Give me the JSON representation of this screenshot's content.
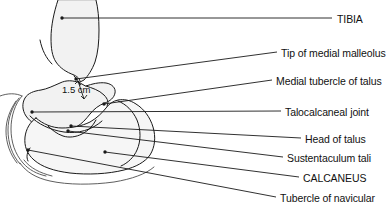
{
  "figure": {
    "type": "anatomical-line-diagram",
    "width": 392,
    "height": 214,
    "background_color": "#ffffff",
    "line_color": "#1a1a1a",
    "bone_fill_color": "#f2f2f2"
  },
  "measurement": {
    "value": "1.5 cm",
    "description": "Distance between tip of medial malleolus and medial tubercle of talus",
    "x": 62,
    "y": 85
  },
  "labels": [
    {
      "id": "tibia",
      "text": "TIBIA",
      "text_x": 337,
      "text_y": 14,
      "line_start_x": 62,
      "line_start_y": 18,
      "line_end_x": 332,
      "line_end_y": 18,
      "dot_x": 62,
      "dot_y": 18
    },
    {
      "id": "tip-of-medial-malleolus",
      "text": "Tip of medial malleolus",
      "text_x": 281,
      "text_y": 48,
      "line_start_x": 76,
      "line_start_y": 79,
      "line_end_x": 277,
      "line_end_y": 52,
      "dot_x": 76,
      "dot_y": 79
    },
    {
      "id": "medial-tubercle-of-talus",
      "text": "Medial tubercle of talus",
      "text_x": 276,
      "text_y": 76,
      "line_start_x": 104,
      "line_start_y": 104,
      "line_end_x": 272,
      "line_end_y": 80,
      "dot_x": 104,
      "dot_y": 104
    },
    {
      "id": "talocalcaneal-joint",
      "text": "Talocalcaneal joint",
      "text_x": 285,
      "text_y": 107,
      "line_start_x": 32,
      "line_start_y": 112,
      "line_end_x": 281,
      "line_end_y": 111,
      "dot_x": 32,
      "dot_y": 112
    },
    {
      "id": "head-of-talus",
      "text": "Head of talus",
      "text_x": 305,
      "text_y": 134,
      "line_start_x": 71,
      "line_start_y": 126,
      "line_end_x": 301,
      "line_end_y": 138,
      "dot_x": 71,
      "dot_y": 126
    },
    {
      "id": "sustentaculum-tali",
      "text": "Sustentaculum tali",
      "text_x": 287,
      "text_y": 153,
      "line_start_x": 68,
      "line_start_y": 131,
      "line_end_x": 283,
      "line_end_y": 157,
      "dot_x": 68,
      "dot_y": 131
    },
    {
      "id": "calcaneus",
      "text": "CALCANEUS",
      "text_x": 303,
      "text_y": 173,
      "line_start_x": 105,
      "line_start_y": 152,
      "line_end_x": 299,
      "line_end_y": 177,
      "dot_x": 105,
      "dot_y": 152
    },
    {
      "id": "tubercle-of-navicular",
      "text": "Tubercle of navicular",
      "text_x": 280,
      "text_y": 193,
      "line_start_x": 28,
      "line_start_y": 150,
      "line_end_x": 276,
      "line_end_y": 197,
      "dot_x": 28,
      "dot_y": 150
    }
  ]
}
